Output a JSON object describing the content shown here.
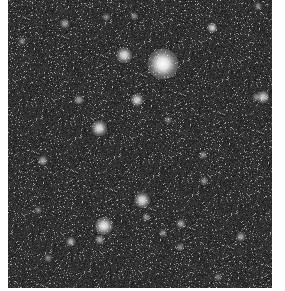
{
  "image": {
    "description": "Grayscale astronomical star field",
    "background_color": "#2a2a2a",
    "margin_color": "#ffffff"
  },
  "stars": [
    {
      "x": 155,
      "y": 64,
      "r": 12,
      "brightness": 1.0
    },
    {
      "x": 116,
      "y": 55,
      "r": 6,
      "brightness": 0.85
    },
    {
      "x": 129,
      "y": 100,
      "r": 5,
      "brightness": 0.8
    },
    {
      "x": 91,
      "y": 128,
      "r": 6,
      "brightness": 0.85
    },
    {
      "x": 255,
      "y": 97,
      "r": 5,
      "brightness": 0.75
    },
    {
      "x": 134,
      "y": 200,
      "r": 6,
      "brightness": 0.85
    },
    {
      "x": 96,
      "y": 226,
      "r": 7,
      "brightness": 0.9
    },
    {
      "x": 204,
      "y": 28,
      "r": 4,
      "brightness": 0.6
    },
    {
      "x": 57,
      "y": 24,
      "r": 4,
      "brightness": 0.55
    },
    {
      "x": 71,
      "y": 100,
      "r": 4,
      "brightness": 0.55
    },
    {
      "x": 35,
      "y": 161,
      "r": 4,
      "brightness": 0.6
    },
    {
      "x": 63,
      "y": 242,
      "r": 4,
      "brightness": 0.6
    },
    {
      "x": 92,
      "y": 240,
      "r": 4,
      "brightness": 0.55
    },
    {
      "x": 138,
      "y": 217,
      "r": 3,
      "brightness": 0.5
    },
    {
      "x": 155,
      "y": 233,
      "r": 3,
      "brightness": 0.5
    },
    {
      "x": 173,
      "y": 224,
      "r": 4,
      "brightness": 0.55
    },
    {
      "x": 233,
      "y": 237,
      "r": 4,
      "brightness": 0.55
    },
    {
      "x": 195,
      "y": 155,
      "r": 3,
      "brightness": 0.5
    },
    {
      "x": 196,
      "y": 181,
      "r": 3,
      "brightness": 0.5
    },
    {
      "x": 205,
      "y": 28,
      "r": 3,
      "brightness": 0.5
    },
    {
      "x": 98,
      "y": 17,
      "r": 3,
      "brightness": 0.45
    },
    {
      "x": 126,
      "y": 16,
      "r": 3,
      "brightness": 0.45
    },
    {
      "x": 14,
      "y": 41,
      "r": 3,
      "brightness": 0.45
    },
    {
      "x": 250,
      "y": 6,
      "r": 3,
      "brightness": 0.45
    },
    {
      "x": 248,
      "y": 97,
      "r": 3,
      "brightness": 0.45
    },
    {
      "x": 40,
      "y": 258,
      "r": 3,
      "brightness": 0.45
    },
    {
      "x": 172,
      "y": 247,
      "r": 3,
      "brightness": 0.45
    },
    {
      "x": 210,
      "y": 277,
      "r": 3,
      "brightness": 0.4
    },
    {
      "x": 30,
      "y": 210,
      "r": 3,
      "brightness": 0.4
    },
    {
      "x": 160,
      "y": 120,
      "r": 3,
      "brightness": 0.4
    }
  ]
}
